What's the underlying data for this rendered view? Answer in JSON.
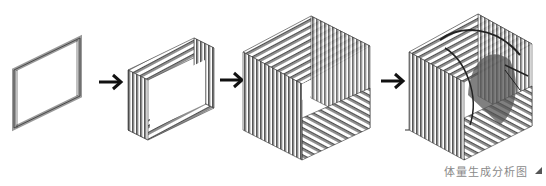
{
  "diagram": {
    "caption": "体量生成分析图",
    "stages": [
      {
        "id": 1,
        "name": "single-frame"
      },
      {
        "id": 2,
        "name": "layered-frames"
      },
      {
        "id": 3,
        "name": "slatted-cube"
      },
      {
        "id": 4,
        "name": "cube-with-curved-interior"
      }
    ],
    "arrows": 3,
    "colors": {
      "line": "#3a3a3a",
      "fill": "#9a9a9a",
      "arrow": "#111111",
      "caption": "#8a8a8a"
    }
  }
}
